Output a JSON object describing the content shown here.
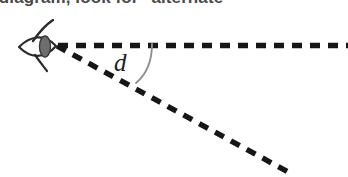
{
  "caption": {
    "text": "ge diagram, look for \"alternate",
    "note_cut_off": true
  },
  "figure": {
    "angle_label": "d",
    "eye_icon_name": "eye-icon",
    "colors": {
      "line": "#161616",
      "arc": "#8c8c8c",
      "eye_outline": "#2b2b2b",
      "iris": "#6e6e6e",
      "caption_text": "#4a4a4a",
      "background": "#ffffff"
    },
    "geometry": {
      "vertex": [
        56,
        45
      ],
      "horizontal_ray_end": [
        348,
        45
      ],
      "diagonal_ray_end": [
        288,
        172
      ],
      "arc_start": [
        152,
        45
      ],
      "arc_end": [
        137,
        82
      ],
      "dash_pattern": "10 8",
      "stroke_width": 5
    },
    "eye": {
      "center": [
        37,
        47
      ],
      "width": 38,
      "height": 30,
      "iris_center": [
        45,
        47
      ],
      "iris_width": 11,
      "iris_height": 21
    }
  }
}
